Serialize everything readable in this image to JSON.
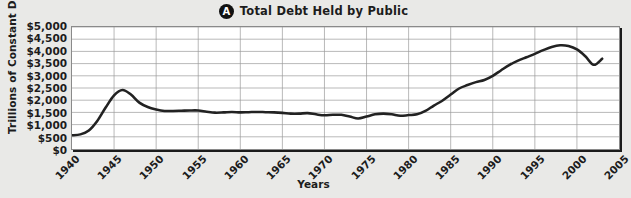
{
  "panel": {
    "badge": "A",
    "title": "Total Debt Held by Public"
  },
  "axes": {
    "ylabel": "Trillions of Constant Dollars",
    "xlabel": "Years"
  },
  "colors": {
    "line": "#222222",
    "grid": "#9a9a9a",
    "plot_background": "#ffffff",
    "page_background": "#e9e9e7",
    "badge": "#111111",
    "text": "#1c1c1c"
  },
  "chart_data": {
    "type": "line",
    "title": "Total Debt Held by Public",
    "xlabel": "Years",
    "ylabel": "Trillions of Constant Dollars",
    "grid": true,
    "legend": null,
    "xlim": [
      1940,
      2005
    ],
    "ylim": [
      0,
      5000
    ],
    "xticks": [
      1940,
      1945,
      1950,
      1955,
      1960,
      1965,
      1970,
      1975,
      1980,
      1985,
      1990,
      1995,
      2000,
      2005
    ],
    "xticklabels": [
      "1940",
      "1945",
      "1950",
      "1955",
      "1960",
      "1965",
      "1970",
      "1975",
      "1980",
      "1985",
      "1990",
      "1995",
      "2000",
      "2005"
    ],
    "yticks": [
      0,
      500,
      1000,
      1500,
      2000,
      2500,
      3000,
      3500,
      4000,
      4500,
      5000
    ],
    "yticklabels": [
      "$0",
      "$500",
      "$1,000",
      "$1,500",
      "$2,000",
      "$2,500",
      "$3,000",
      "$3,500",
      "$4,000",
      "$4,500",
      "$5,000"
    ],
    "series": [
      {
        "name": "Total Debt Held by Public",
        "x": [
          1940,
          1941,
          1942,
          1943,
          1944,
          1945,
          1946,
          1947,
          1948,
          1949,
          1950,
          1951,
          1952,
          1953,
          1954,
          1955,
          1956,
          1957,
          1958,
          1959,
          1960,
          1961,
          1962,
          1963,
          1964,
          1965,
          1966,
          1967,
          1968,
          1969,
          1970,
          1971,
          1972,
          1973,
          1974,
          1975,
          1976,
          1977,
          1978,
          1979,
          1980,
          1981,
          1982,
          1983,
          1984,
          1985,
          1986,
          1987,
          1988,
          1989,
          1990,
          1991,
          1992,
          1993,
          1994,
          1995,
          1996,
          1997,
          1998,
          1999,
          2000,
          2001,
          2002,
          2003
        ],
        "y": [
          560,
          600,
          760,
          1150,
          1700,
          2200,
          2420,
          2230,
          1900,
          1720,
          1620,
          1560,
          1560,
          1570,
          1580,
          1580,
          1530,
          1490,
          1500,
          1520,
          1500,
          1510,
          1520,
          1510,
          1500,
          1480,
          1450,
          1450,
          1470,
          1420,
          1380,
          1400,
          1400,
          1330,
          1250,
          1330,
          1420,
          1450,
          1420,
          1360,
          1390,
          1420,
          1560,
          1780,
          1980,
          2230,
          2480,
          2620,
          2740,
          2830,
          3000,
          3230,
          3450,
          3620,
          3760,
          3900,
          4050,
          4180,
          4250,
          4220,
          4080,
          3800,
          3450,
          3700
        ]
      }
    ],
    "annotations": []
  }
}
